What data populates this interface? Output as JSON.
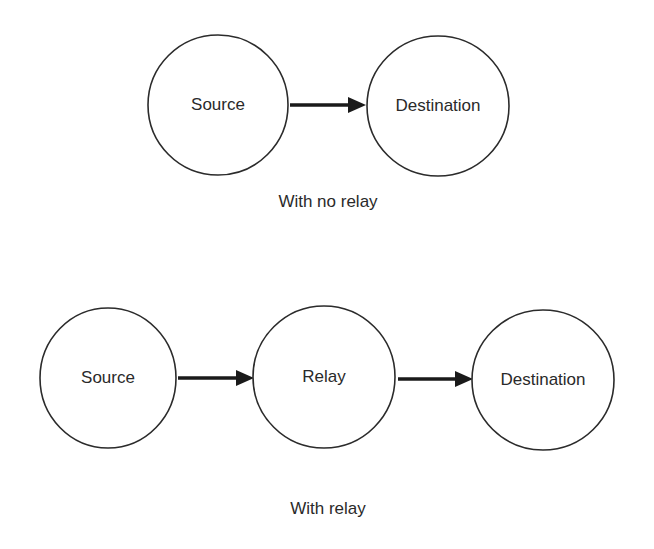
{
  "figure": {
    "background_color": "#ffffff",
    "stroke_color": "#2b2b2b",
    "arrow_color": "#1a1a1a",
    "text_color": "#2a2a2a"
  },
  "diagrams": [
    {
      "id": "no-relay",
      "caption": "With no relay",
      "nodes": [
        {
          "id": "source",
          "label": "Source",
          "cx": 218,
          "cy": 105,
          "rx": 70,
          "ry": 70
        },
        {
          "id": "destination",
          "label": "Destination",
          "cx": 438,
          "cy": 106,
          "rx": 71,
          "ry": 70
        }
      ],
      "edges": [
        {
          "id": "source-to-destination",
          "from": "source",
          "to": "destination",
          "x1": 290,
          "x2": 366,
          "y": 105
        }
      ],
      "caption_x": 328,
      "caption_y": 203
    },
    {
      "id": "with-relay",
      "caption": "With relay",
      "nodes": [
        {
          "id": "source",
          "label": "Source",
          "cx": 108,
          "cy": 378,
          "rx": 68,
          "ry": 70
        },
        {
          "id": "relay",
          "label": "Relay",
          "cx": 324,
          "cy": 377,
          "rx": 71,
          "ry": 71
        },
        {
          "id": "destination",
          "label": "Destination",
          "cx": 543,
          "cy": 380,
          "rx": 71,
          "ry": 70
        }
      ],
      "edges": [
        {
          "id": "source-to-relay",
          "from": "source",
          "to": "relay",
          "x1": 178,
          "x2": 254,
          "y": 378
        },
        {
          "id": "relay-to-destination",
          "from": "relay",
          "to": "destination",
          "x1": 398,
          "x2": 473,
          "y": 379
        }
      ],
      "caption_x": 328,
      "caption_y": 510
    }
  ]
}
